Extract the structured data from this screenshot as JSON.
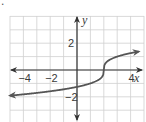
{
  "marker": {
    "bullet": "."
  },
  "chart_data": {
    "type": "line",
    "title": "",
    "function": "y = cbrt(x - 2)",
    "xlabel": "x",
    "ylabel": "y",
    "xlim": [
      -5,
      5
    ],
    "ylim": [
      -4,
      4
    ],
    "grid": true,
    "grid_step": 1,
    "x_tick_labels": [
      {
        "value": -4,
        "label": "−4"
      },
      {
        "value": -2,
        "label": "−2"
      },
      {
        "value": 4,
        "label": "4"
      }
    ],
    "y_tick_labels": [
      {
        "value": 2,
        "label": "2"
      },
      {
        "value": -2,
        "label": "−2"
      }
    ],
    "series": [
      {
        "name": "f(x)",
        "color": "#555555",
        "arrows": "both",
        "x": [
          -5.0,
          -4.0,
          -3.0,
          -2.0,
          -1.0,
          0.0,
          1.0,
          1.5,
          1.8,
          1.95,
          2.0,
          2.05,
          2.2,
          2.5,
          3.0,
          4.0,
          4.6
        ],
        "y": [
          -1.91,
          -1.82,
          -1.71,
          -1.59,
          -1.44,
          -1.26,
          -1.0,
          -0.79,
          -0.58,
          -0.37,
          0.0,
          0.37,
          0.58,
          0.79,
          1.0,
          1.26,
          1.38
        ]
      }
    ]
  },
  "colors": {
    "grid": "#cfcfcf",
    "axis": "#333333",
    "curve": "#555555",
    "text": "#3a3a3a"
  }
}
